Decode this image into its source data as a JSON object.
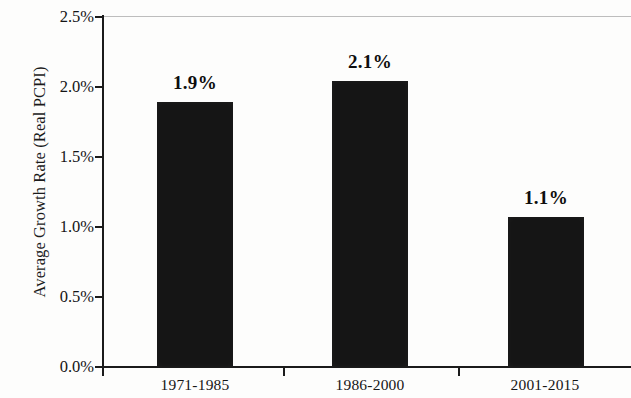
{
  "chart_data": {
    "type": "bar",
    "title": "",
    "xlabel": "",
    "ylabel": "Average Growth Rate (Real PCPI)",
    "categories": [
      "1971-1985",
      "1986-2000",
      "2001-2015"
    ],
    "values": [
      1.9,
      2.1,
      1.1
    ],
    "value_labels": [
      "1.9%",
      "2.1%",
      "1.1%"
    ],
    "ylim": [
      0.0,
      2.5
    ],
    "y_tick_values": [
      2.5,
      2.0,
      1.5,
      1.0,
      0.5,
      0.0
    ],
    "y_tick_labels": [
      "2.5%",
      "2.0%",
      "1.5%",
      "1.0%",
      "0.5%",
      "0.0%"
    ],
    "grid": false,
    "legend": false,
    "legend_position": "none",
    "series": [
      {
        "name": "Average Growth Rate (Real PCPI)",
        "values": [
          1.9,
          2.1,
          1.1
        ],
        "color": "#151515"
      }
    ],
    "bar_color": "#151515",
    "axis_color": "#1b1b1b",
    "background_color": "#fdfdfc"
  }
}
